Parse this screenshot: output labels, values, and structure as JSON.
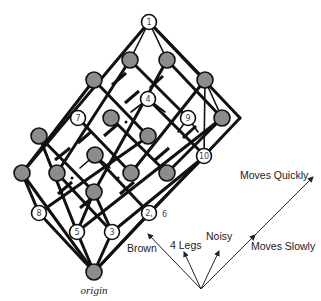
{
  "diagram": {
    "type": "lattice",
    "origin_label": "origin",
    "node_labels": {
      "n1": "1",
      "n4": "4",
      "n7": "7",
      "n9": "9",
      "n10": "10",
      "n8": "8",
      "n5": "5",
      "n3": "3",
      "n2": "2,",
      "n2_extra": "6"
    },
    "axes": [
      {
        "label": "Brown"
      },
      {
        "label": "4 Legs"
      },
      {
        "label": "Noisy"
      },
      {
        "label": "Moves Slowly"
      },
      {
        "label": "Moves Quickly"
      }
    ],
    "colors": {
      "filled_node": "#8c8c8c",
      "empty_node": "#ffffff",
      "edge": "#111111"
    }
  }
}
